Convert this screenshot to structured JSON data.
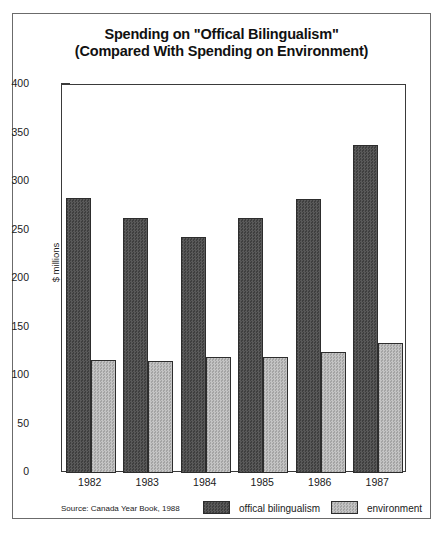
{
  "chart_data": {
    "type": "bar",
    "title": "Spending on \"Offical Bilingualism\"",
    "subtitle": "(Compared With Spending on Environment)",
    "xlabel": "",
    "ylabel": "$ millions",
    "ylim": [
      0,
      400
    ],
    "ytick_step": 50,
    "yminor_step": 10,
    "grid": false,
    "legend_position": "bottom",
    "categories": [
      "1982",
      "1983",
      "1984",
      "1985",
      "1986",
      "1987"
    ],
    "ytick_labels": [
      "0",
      "50",
      "100",
      "150",
      "200",
      "250",
      "300",
      "350",
      "400"
    ],
    "series": [
      {
        "name": "offical bilingualism",
        "color": "#4d4d4d",
        "values": [
          283,
          263,
          243,
          263,
          282,
          338
        ]
      },
      {
        "name": "environment",
        "color": "#b4b4b4",
        "values": [
          116,
          115,
          120,
          120,
          125,
          134
        ]
      }
    ],
    "source": "Source: Canada Year Book, 1988"
  }
}
